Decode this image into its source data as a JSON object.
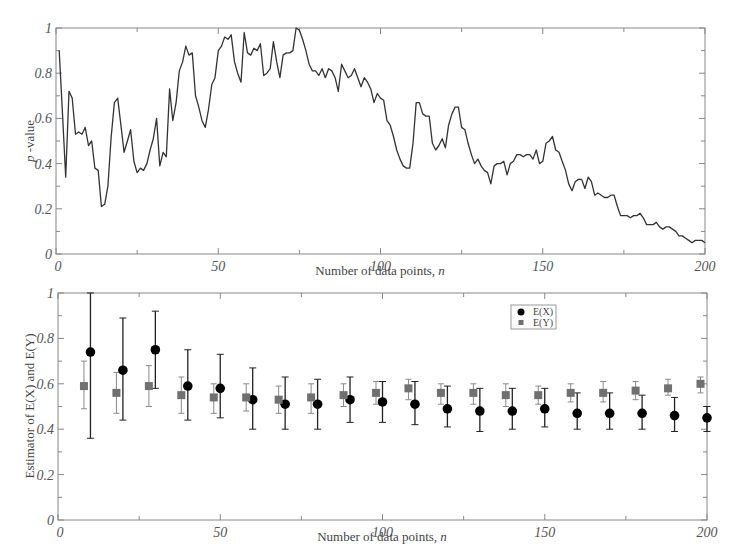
{
  "chart_data": [
    {
      "type": "line",
      "title": "",
      "xlabel": "Number of data points, n",
      "ylabel": "p -value",
      "xlim": [
        0,
        200
      ],
      "ylim": [
        0,
        1
      ],
      "xticks": [
        "0",
        "50",
        "100",
        "150",
        "200"
      ],
      "yticks": [
        "0",
        "0.2",
        "0.4",
        "0.6",
        "0.8",
        "1"
      ],
      "grid": false,
      "legend": null,
      "series": [
        {
          "name": "p-value",
          "color": "#333333",
          "x": [
            1,
            2,
            3,
            4,
            5,
            6,
            7,
            8,
            9,
            10,
            11,
            12,
            13,
            14,
            15,
            16,
            17,
            18,
            19,
            20,
            21,
            22,
            23,
            24,
            25,
            26,
            27,
            28,
            29,
            30,
            31,
            32,
            33,
            34,
            35,
            36,
            37,
            38,
            39,
            40,
            41,
            42,
            43,
            44,
            45,
            46,
            47,
            48,
            49,
            50,
            51,
            52,
            53,
            54,
            55,
            56,
            57,
            58,
            59,
            60,
            61,
            62,
            63,
            64,
            65,
            66,
            67,
            68,
            69,
            70,
            71,
            72,
            73,
            74,
            75,
            76,
            77,
            78,
            79,
            80,
            81,
            82,
            83,
            84,
            85,
            86,
            87,
            88,
            89,
            90,
            91,
            92,
            93,
            94,
            95,
            96,
            97,
            98,
            99,
            100,
            101,
            102,
            103,
            104,
            105,
            106,
            107,
            108,
            109,
            110,
            111,
            112,
            113,
            114,
            115,
            116,
            117,
            118,
            119,
            120,
            121,
            122,
            123,
            124,
            125,
            126,
            127,
            128,
            129,
            130,
            131,
            132,
            133,
            134,
            135,
            136,
            137,
            138,
            139,
            140,
            141,
            142,
            143,
            144,
            145,
            146,
            147,
            148,
            149,
            150,
            151,
            152,
            153,
            154,
            155,
            156,
            157,
            158,
            159,
            160,
            161,
            162,
            163,
            164,
            165,
            166,
            167,
            168,
            169,
            170,
            171,
            172,
            173,
            174,
            175,
            176,
            177,
            178,
            179,
            180,
            181,
            182,
            183,
            184,
            185,
            186,
            187,
            188,
            189,
            190,
            191,
            192,
            193,
            194,
            195,
            196,
            197,
            198,
            199,
            200
          ],
          "y": [
            0.9,
            0.62,
            0.34,
            0.72,
            0.69,
            0.53,
            0.54,
            0.53,
            0.56,
            0.48,
            0.5,
            0.38,
            0.37,
            0.21,
            0.22,
            0.3,
            0.52,
            0.67,
            0.69,
            0.57,
            0.45,
            0.5,
            0.55,
            0.41,
            0.36,
            0.38,
            0.37,
            0.4,
            0.46,
            0.51,
            0.6,
            0.39,
            0.45,
            0.43,
            0.73,
            0.59,
            0.67,
            0.81,
            0.85,
            0.92,
            0.88,
            0.89,
            0.7,
            0.65,
            0.59,
            0.56,
            0.64,
            0.75,
            0.78,
            0.9,
            0.92,
            0.96,
            0.95,
            0.97,
            0.85,
            0.8,
            0.76,
            0.98,
            0.89,
            0.88,
            0.91,
            0.9,
            0.93,
            0.79,
            0.8,
            0.82,
            0.94,
            0.85,
            0.78,
            0.88,
            0.89,
            0.89,
            0.9,
            1.0,
            0.99,
            0.95,
            0.9,
            0.84,
            0.81,
            0.81,
            0.79,
            0.82,
            0.78,
            0.82,
            0.81,
            0.78,
            0.72,
            0.84,
            0.81,
            0.78,
            0.79,
            0.82,
            0.78,
            0.74,
            0.78,
            0.76,
            0.73,
            0.67,
            0.71,
            0.69,
            0.68,
            0.59,
            0.57,
            0.52,
            0.46,
            0.42,
            0.39,
            0.38,
            0.38,
            0.49,
            0.67,
            0.67,
            0.62,
            0.61,
            0.61,
            0.49,
            0.46,
            0.48,
            0.51,
            0.47,
            0.57,
            0.62,
            0.65,
            0.65,
            0.56,
            0.55,
            0.49,
            0.44,
            0.4,
            0.42,
            0.39,
            0.37,
            0.36,
            0.31,
            0.39,
            0.4,
            0.4,
            0.41,
            0.35,
            0.4,
            0.41,
            0.44,
            0.44,
            0.43,
            0.44,
            0.44,
            0.42,
            0.46,
            0.4,
            0.41,
            0.49,
            0.5,
            0.52,
            0.46,
            0.45,
            0.41,
            0.37,
            0.31,
            0.28,
            0.32,
            0.33,
            0.33,
            0.29,
            0.34,
            0.32,
            0.26,
            0.27,
            0.26,
            0.25,
            0.25,
            0.26,
            0.26,
            0.21,
            0.17,
            0.17,
            0.17,
            0.16,
            0.17,
            0.17,
            0.18,
            0.16,
            0.13,
            0.13,
            0.13,
            0.14,
            0.12,
            0.11,
            0.12,
            0.12,
            0.11,
            0.1,
            0.08,
            0.08,
            0.07,
            0.06,
            0.05,
            0.06,
            0.06,
            0.06,
            0.05
          ],
          "x_step_note": "approximate trace read from figure"
        }
      ]
    },
    {
      "type": "scatter",
      "title": "",
      "xlabel": "Number of data points, n",
      "ylabel": "Estimator of E(X) and E(Y)",
      "xlim": [
        0,
        200
      ],
      "ylim": [
        0,
        1
      ],
      "xticks": [
        "0",
        "50",
        "100",
        "150",
        "200"
      ],
      "yticks": [
        "0",
        "0.2",
        "0.4",
        "0.6",
        "0.8",
        "1"
      ],
      "grid": false,
      "legend": {
        "position": "upper right-center",
        "entries": [
          "E(X)",
          "E(Y)"
        ]
      },
      "series": [
        {
          "name": "E(X)",
          "marker": "circle",
          "color": "#000000",
          "x": [
            10,
            20,
            30,
            40,
            50,
            60,
            70,
            80,
            90,
            100,
            110,
            120,
            130,
            140,
            150,
            160,
            170,
            180,
            190,
            200
          ],
          "y": [
            0.74,
            0.66,
            0.75,
            0.59,
            0.58,
            0.53,
            0.51,
            0.51,
            0.53,
            0.52,
            0.51,
            0.49,
            0.48,
            0.48,
            0.49,
            0.47,
            0.47,
            0.47,
            0.46,
            0.45
          ],
          "err_low": [
            0.36,
            0.44,
            0.58,
            0.44,
            0.45,
            0.4,
            0.4,
            0.4,
            0.43,
            0.43,
            0.42,
            0.41,
            0.39,
            0.4,
            0.41,
            0.4,
            0.4,
            0.4,
            0.39,
            0.39
          ],
          "err_high": [
            1.0,
            0.89,
            0.92,
            0.75,
            0.73,
            0.67,
            0.63,
            0.62,
            0.63,
            0.61,
            0.61,
            0.59,
            0.58,
            0.58,
            0.58,
            0.56,
            0.56,
            0.55,
            0.54,
            0.5
          ]
        },
        {
          "name": "E(Y)",
          "marker": "square",
          "color": "#707070",
          "x": [
            8,
            18,
            28,
            38,
            48,
            58,
            68,
            78,
            88,
            98,
            108,
            118,
            128,
            138,
            148,
            158,
            168,
            178,
            188,
            198
          ],
          "y": [
            0.59,
            0.56,
            0.59,
            0.55,
            0.54,
            0.54,
            0.53,
            0.54,
            0.55,
            0.56,
            0.58,
            0.56,
            0.56,
            0.55,
            0.55,
            0.56,
            0.56,
            0.57,
            0.58,
            0.6
          ],
          "err_low": [
            0.49,
            0.47,
            0.5,
            0.47,
            0.47,
            0.48,
            0.47,
            0.47,
            0.5,
            0.51,
            0.53,
            0.51,
            0.51,
            0.5,
            0.51,
            0.52,
            0.52,
            0.53,
            0.55,
            0.56
          ],
          "err_high": [
            0.7,
            0.65,
            0.68,
            0.63,
            0.6,
            0.6,
            0.59,
            0.6,
            0.6,
            0.61,
            0.62,
            0.6,
            0.6,
            0.6,
            0.59,
            0.6,
            0.61,
            0.61,
            0.62,
            0.63
          ]
        }
      ]
    }
  ],
  "top_plot": {
    "ylabel_italic": "p",
    "ylabel_rest": " -value",
    "xlabel_text": "Number of data points, ",
    "xlabel_var": "n"
  },
  "bottom_plot": {
    "ylabel": "Estimator of E(X) and E(Y)",
    "xlabel_text": "Number of data points, ",
    "xlabel_var": "n",
    "legend": [
      {
        "label": "E(X)",
        "marker": "circle",
        "color": "#000000"
      },
      {
        "label": "E(Y)",
        "marker": "square",
        "color": "#707070"
      }
    ]
  }
}
